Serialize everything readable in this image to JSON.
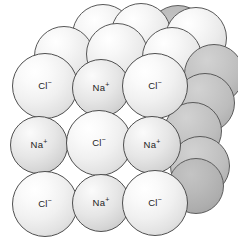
{
  "figure": {
    "background": "#ffffff",
    "outline_color": "#4f4f4f",
    "chloride_color": "#f0f0f0",
    "sodium_color": "#e0e0e0",
    "shadow_color": "#b5b5b5"
  },
  "labels": {
    "chloride": "Cl",
    "chloride_charge": "−",
    "sodium": "Na",
    "sodium_charge": "+"
  },
  "lattice": {
    "front_face_rows": [
      {
        "row": 1,
        "ions": [
          "Cl-",
          "Na+",
          "Cl-"
        ]
      },
      {
        "row": 2,
        "ions": [
          "Na+",
          "Cl-",
          "Na+"
        ]
      },
      {
        "row": 3,
        "ions": [
          "Cl-",
          "Na+",
          "Cl-"
        ]
      }
    ],
    "spheres": [
      {
        "id": "b-r0-c0",
        "kind": "shade2",
        "cx": 178,
        "cy": 36,
        "r": 31,
        "layer": 0,
        "label": null
      },
      {
        "id": "b-r0-c1",
        "kind": "back",
        "cx": 103,
        "cy": 35,
        "r": 31,
        "layer": 0,
        "label": null
      },
      {
        "id": "b-r0-c2",
        "kind": "back",
        "cx": 141,
        "cy": 33,
        "r": 30,
        "layer": 0,
        "label": null
      },
      {
        "id": "b-r0-c3",
        "kind": "back",
        "cx": 196,
        "cy": 38,
        "r": 31,
        "layer": 0,
        "label": null
      },
      {
        "id": "b-r1-c0",
        "kind": "back",
        "cx": 64,
        "cy": 56,
        "r": 30,
        "layer": 1,
        "label": null
      },
      {
        "id": "b-r1-c1",
        "kind": "back",
        "cx": 117,
        "cy": 54,
        "r": 31,
        "layer": 1,
        "label": null
      },
      {
        "id": "b-r1-c2",
        "kind": "back",
        "cx": 172,
        "cy": 57,
        "r": 30,
        "layer": 1,
        "label": null
      },
      {
        "id": "b-r1-c3",
        "kind": "shade",
        "cx": 214,
        "cy": 74,
        "r": 30,
        "layer": 1,
        "label": null
      },
      {
        "id": "f-r0-c0",
        "kind": "cl",
        "cx": 45,
        "cy": 86,
        "r": 33,
        "layer": 3,
        "label": "Cl-"
      },
      {
        "id": "f-r0-c1",
        "kind": "na",
        "cx": 101,
        "cy": 88,
        "r": 29,
        "layer": 3,
        "label": "Na+"
      },
      {
        "id": "f-r0-c2",
        "kind": "cl",
        "cx": 155,
        "cy": 86,
        "r": 33,
        "layer": 3,
        "label": "Cl-"
      },
      {
        "id": "s-r0",
        "kind": "shade",
        "cx": 205,
        "cy": 103,
        "r": 30,
        "layer": 2,
        "label": null
      },
      {
        "id": "f-r1-c0",
        "kind": "na",
        "cx": 39,
        "cy": 145,
        "r": 29,
        "layer": 4,
        "label": "Na+"
      },
      {
        "id": "f-r1-c1",
        "kind": "cl",
        "cx": 99,
        "cy": 143,
        "r": 33,
        "layer": 4,
        "label": "Cl-"
      },
      {
        "id": "f-r1-c2",
        "kind": "na",
        "cx": 152,
        "cy": 145,
        "r": 29,
        "layer": 4,
        "label": "Na+"
      },
      {
        "id": "s-r1a",
        "kind": "shade",
        "cx": 193,
        "cy": 131,
        "r": 29,
        "layer": 2,
        "label": null
      },
      {
        "id": "s-r1b",
        "kind": "shade",
        "cx": 200,
        "cy": 166,
        "r": 30,
        "layer": 2,
        "label": null
      },
      {
        "id": "f-r2-c0",
        "kind": "cl",
        "cx": 45,
        "cy": 204,
        "r": 33,
        "layer": 5,
        "label": "Cl-"
      },
      {
        "id": "f-r2-c1",
        "kind": "na",
        "cx": 101,
        "cy": 203,
        "r": 29,
        "layer": 5,
        "label": "Na+"
      },
      {
        "id": "f-r2-c2",
        "kind": "cl",
        "cx": 155,
        "cy": 203,
        "r": 33,
        "layer": 5,
        "label": "Cl-"
      },
      {
        "id": "s-r2",
        "kind": "shade2",
        "cx": 196,
        "cy": 186,
        "r": 28,
        "layer": 2,
        "label": null
      }
    ]
  }
}
